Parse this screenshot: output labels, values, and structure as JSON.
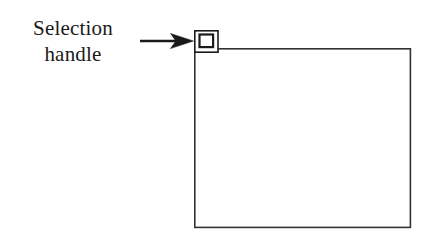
{
  "figure": {
    "caption_lines": [
      "Selection",
      "handle"
    ],
    "background_color": "#ffffff",
    "ink_color": "#1a1a1a",
    "stroke_color": "#333333"
  },
  "annotation": {
    "label_line_1": "Selection",
    "label_line_2": "handle",
    "arrow": {
      "name": "pointer-arrow",
      "direction": "right",
      "tail_x": 140,
      "tip_x": 192,
      "y": 41
    }
  },
  "shapes": {
    "main_rectangle": {
      "name": "content-rectangle",
      "x": 194,
      "y": 48,
      "width": 217,
      "height": 180,
      "fill": "none",
      "stroke": "#333333",
      "stroke_width": 1.6
    },
    "selection_handle": {
      "name": "selection-handle",
      "outer": {
        "x": 194,
        "y": 30,
        "width": 24,
        "height": 22
      },
      "inner": {
        "x": 199,
        "y": 34,
        "width": 14,
        "height": 13
      },
      "stroke": "#1a1a1a",
      "outer_stroke_width": 1.6,
      "inner_stroke_width": 2.2
    }
  }
}
